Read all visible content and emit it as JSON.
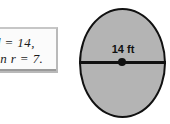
{
  "figure": {
    "type": "circle-diagram",
    "background_color": "#ffffff"
  },
  "note_box": {
    "name": "clipped-note-box",
    "clipped": "left",
    "background_color": "#fbfbfb",
    "border_color": "#b9b9b9",
    "lines": [
      "d = 14,",
      "en r = 7."
    ]
  },
  "circle": {
    "name": "shaded-circle",
    "fill_color": "#b4b4b4",
    "stroke_color": "#111111",
    "diameter_label": "14 ft",
    "has_center_dot": true,
    "has_diameter_line": true
  },
  "chart_data": {
    "type": "diagram",
    "shape": "circle",
    "measurement": {
      "label": "14 ft",
      "value": 14,
      "unit": "ft",
      "quantity": "diameter"
    },
    "related_values": {
      "d": 14,
      "r": 7
    },
    "annotations": [
      "14 ft",
      "d = 14,",
      "en r = 7."
    ]
  }
}
